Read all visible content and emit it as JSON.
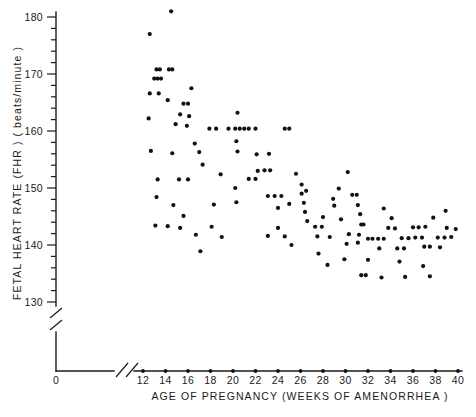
{
  "chart_data": {
    "type": "scatter",
    "title": "",
    "xlabel": "AGE OF PREGNANCY (WEEKS OF AMENORRHEA )",
    "ylabel": "FETAL HEART RATE (FHR ) ( beats/minute )",
    "xlim": [
      12,
      40
    ],
    "ylim": [
      128,
      182
    ],
    "origin_label": "0",
    "grid": false,
    "legend": null,
    "x_axis_break": true,
    "y_axis_break": true,
    "xticks": [
      12,
      14,
      16,
      18,
      20,
      22,
      24,
      26,
      28,
      30,
      32,
      34,
      36,
      38,
      40
    ],
    "xtick_labels": [
      "12",
      "14",
      "16",
      "18",
      "20",
      "22",
      "24",
      "26",
      "28",
      "30",
      "32",
      "34",
      "36",
      "38",
      "40"
    ],
    "yticks": [
      130,
      140,
      150,
      160,
      170,
      180
    ],
    "ytick_labels": [
      "130",
      "140",
      "150",
      "160",
      "170",
      "180"
    ],
    "yminor_ticks": [
      132,
      134,
      136,
      138,
      142,
      144,
      146,
      148,
      152,
      154,
      156,
      158,
      162,
      164,
      166,
      168,
      172,
      174,
      176,
      178
    ],
    "marker": "filled-circle",
    "marker_color": "#111111",
    "points": [
      [
        12.6,
        177.0
      ],
      [
        14.5,
        181.0
      ],
      [
        13.2,
        170.8
      ],
      [
        13.5,
        170.8
      ],
      [
        14.3,
        170.8
      ],
      [
        14.6,
        170.8
      ],
      [
        13.0,
        169.2
      ],
      [
        13.3,
        169.2
      ],
      [
        13.6,
        169.2
      ],
      [
        12.6,
        166.6
      ],
      [
        13.4,
        166.6
      ],
      [
        14.2,
        165.4
      ],
      [
        16.3,
        167.5
      ],
      [
        15.6,
        164.8
      ],
      [
        16.0,
        164.8
      ],
      [
        15.3,
        162.9
      ],
      [
        16.1,
        162.6
      ],
      [
        12.5,
        162.2
      ],
      [
        14.9,
        161.2
      ],
      [
        15.9,
        160.9
      ],
      [
        17.9,
        160.4
      ],
      [
        18.5,
        160.4
      ],
      [
        19.6,
        160.4
      ],
      [
        20.2,
        160.4
      ],
      [
        20.6,
        160.4
      ],
      [
        21.0,
        160.4
      ],
      [
        21.4,
        160.4
      ],
      [
        22.0,
        160.4
      ],
      [
        24.6,
        160.4
      ],
      [
        25.0,
        160.4
      ],
      [
        20.4,
        163.2
      ],
      [
        20.3,
        158.2
      ],
      [
        20.4,
        156.4
      ],
      [
        16.6,
        157.8
      ],
      [
        12.7,
        156.5
      ],
      [
        14.6,
        156.1
      ],
      [
        17.0,
        156.3
      ],
      [
        17.3,
        154.1
      ],
      [
        18.9,
        152.4
      ],
      [
        22.1,
        155.9
      ],
      [
        23.2,
        156.0
      ],
      [
        22.2,
        153.0
      ],
      [
        22.8,
        153.1
      ],
      [
        23.3,
        153.1
      ],
      [
        13.3,
        151.5
      ],
      [
        15.2,
        151.5
      ],
      [
        16.0,
        151.5
      ],
      [
        21.4,
        151.6
      ],
      [
        22.0,
        151.6
      ],
      [
        20.2,
        150.0
      ],
      [
        13.2,
        148.4
      ],
      [
        14.7,
        147.0
      ],
      [
        15.6,
        145.1
      ],
      [
        18.3,
        147.1
      ],
      [
        20.3,
        147.5
      ],
      [
        23.1,
        148.6
      ],
      [
        23.7,
        148.6
      ],
      [
        24.3,
        148.6
      ],
      [
        24.0,
        146.5
      ],
      [
        25.0,
        147.2
      ],
      [
        25.6,
        152.5
      ],
      [
        26.1,
        150.6
      ],
      [
        26.1,
        149.0
      ],
      [
        26.5,
        149.5
      ],
      [
        26.3,
        147.4
      ],
      [
        26.4,
        145.8
      ],
      [
        26.6,
        144.2
      ],
      [
        27.3,
        143.2
      ],
      [
        27.9,
        143.2
      ],
      [
        28.0,
        144.9
      ],
      [
        27.5,
        141.5
      ],
      [
        28.6,
        141.4
      ],
      [
        29.0,
        146.9
      ],
      [
        28.9,
        148.1
      ],
      [
        29.4,
        149.9
      ],
      [
        30.2,
        152.8
      ],
      [
        29.6,
        144.5
      ],
      [
        30.6,
        148.8
      ],
      [
        31.0,
        148.8
      ],
      [
        31.1,
        147.0
      ],
      [
        31.3,
        145.4
      ],
      [
        31.4,
        143.6
      ],
      [
        31.6,
        143.6
      ],
      [
        31.2,
        141.8
      ],
      [
        31.1,
        140.4
      ],
      [
        30.3,
        141.9
      ],
      [
        30.1,
        140.2
      ],
      [
        32.0,
        141.1
      ],
      [
        32.4,
        141.1
      ],
      [
        32.9,
        141.1
      ],
      [
        33.4,
        141.1
      ],
      [
        33.0,
        139.4
      ],
      [
        28.4,
        136.5
      ],
      [
        32.0,
        137.4
      ],
      [
        31.4,
        134.7
      ],
      [
        31.8,
        134.7
      ],
      [
        34.1,
        144.7
      ],
      [
        34.4,
        142.9
      ],
      [
        35.0,
        141.2
      ],
      [
        35.6,
        141.2
      ],
      [
        34.6,
        139.4
      ],
      [
        35.2,
        139.4
      ],
      [
        34.8,
        137.1
      ],
      [
        33.4,
        146.4
      ],
      [
        33.8,
        143.0
      ],
      [
        36.0,
        143.1
      ],
      [
        36.5,
        143.1
      ],
      [
        36.2,
        141.3
      ],
      [
        36.8,
        141.3
      ],
      [
        37.0,
        139.7
      ],
      [
        37.5,
        139.7
      ],
      [
        37.1,
        143.2
      ],
      [
        37.8,
        144.8
      ],
      [
        38.2,
        141.3
      ],
      [
        38.8,
        141.3
      ],
      [
        38.4,
        139.6
      ],
      [
        39.0,
        143.0
      ],
      [
        39.4,
        141.4
      ],
      [
        39.8,
        142.8
      ],
      [
        38.9,
        146.0
      ],
      [
        36.9,
        136.3
      ],
      [
        37.5,
        134.5
      ],
      [
        35.3,
        134.4
      ],
      [
        33.2,
        134.3
      ],
      [
        29.9,
        137.5
      ],
      [
        27.6,
        138.5
      ],
      [
        24.0,
        143.0
      ],
      [
        24.6,
        141.5
      ],
      [
        23.1,
        141.6
      ],
      [
        25.2,
        140.0
      ],
      [
        18.1,
        143.2
      ],
      [
        19.0,
        141.4
      ],
      [
        16.7,
        141.8
      ],
      [
        15.3,
        143.0
      ],
      [
        14.2,
        143.3
      ],
      [
        13.1,
        143.4
      ],
      [
        17.1,
        138.9
      ]
    ]
  },
  "footer": {
    "note": ""
  }
}
